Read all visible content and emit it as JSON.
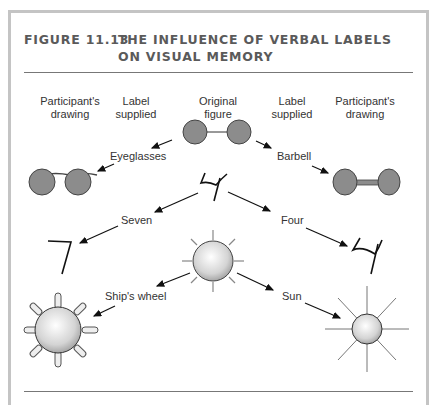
{
  "figure": {
    "number": "FIGURE 11.13",
    "title_line1": "THE INFLUENCE OF VERBAL LABELS",
    "title_line2": "ON VISUAL MEMORY"
  },
  "columns": {
    "col1_line1": "Participant's",
    "col1_line2": "drawing",
    "col2_line1": "Label",
    "col2_line2": "supplied",
    "col3_line1": "Original",
    "col3_line2": "figure",
    "col4_line1": "Label",
    "col4_line2": "supplied",
    "col5_line1": "Participant's",
    "col5_line2": "drawing"
  },
  "rows": [
    {
      "original": "two-circles-joined",
      "left_label": "Eyeglasses",
      "left_drawing": "eyeglasses",
      "right_label": "Barbell",
      "right_drawing": "barbell"
    },
    {
      "original": "ambiguous-figure-4",
      "left_label": "Seven",
      "left_drawing": "number-7",
      "right_label": "Four",
      "right_drawing": "number-4"
    },
    {
      "original": "circle-with-rays",
      "left_label": "Ship's wheel",
      "left_drawing": "ships-wheel",
      "right_label": "Sun",
      "right_drawing": "sun"
    }
  ],
  "colors": {
    "frame": "#c4c4c4",
    "title": "#5a5a5a",
    "circle_fill": "#8c8c8c",
    "stroke": "#333333"
  }
}
